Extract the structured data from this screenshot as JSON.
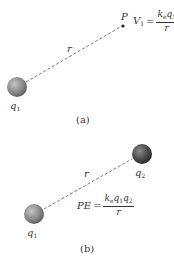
{
  "panel_a": {
    "caption": "(a)",
    "charge_label": "q",
    "charge_sub": "1",
    "point_label": "P",
    "distance_label": "r",
    "equation": {
      "lhs": "V",
      "lhs_sub": "1",
      "equals": "=",
      "numerator": "k",
      "numerator_sub1": "e",
      "numerator_q": "q",
      "numerator_sub2": "1",
      "denominator": "r"
    }
  },
  "panel_b": {
    "caption": "(b)",
    "charge1_label": "q",
    "charge1_sub": "1",
    "charge2_label": "q",
    "charge2_sub": "2",
    "distance_label": "r",
    "equation": {
      "lhs": "PE",
      "equals": "=",
      "numerator": "k",
      "numerator_sub1": "e",
      "numerator_q1": "q",
      "numerator_q1_sub": "1",
      "numerator_q2": "q",
      "numerator_q2_sub": "2",
      "denominator": "r"
    }
  },
  "colors": {
    "sphere_light": "#b8b8b8",
    "sphere_mid": "#8a8a8a",
    "sphere_dark": "#505050",
    "sphere2_mid": "#555555",
    "sphere2_dark": "#2a2a2a",
    "line": "#555555",
    "text": "#333333"
  }
}
